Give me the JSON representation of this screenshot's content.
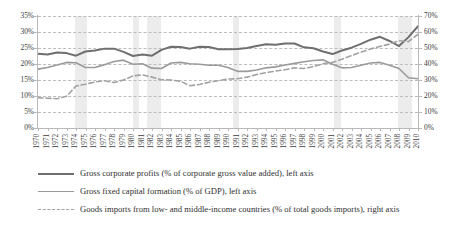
{
  "chart_data": {
    "type": "line",
    "title": "",
    "xlabel": "",
    "ylabel": "",
    "grid": true,
    "legend_position": "bottom-left",
    "x": [
      1970,
      1971,
      1972,
      1973,
      1974,
      1975,
      1976,
      1977,
      1978,
      1979,
      1980,
      1981,
      1982,
      1983,
      1984,
      1985,
      1986,
      1987,
      1988,
      1989,
      1990,
      1991,
      1992,
      1993,
      1994,
      1995,
      1996,
      1997,
      1998,
      1999,
      2000,
      2001,
      2002,
      2003,
      2004,
      2005,
      2006,
      2007,
      2008,
      2009,
      2010
    ],
    "xtick_labels": [
      "1970",
      "1971",
      "1972",
      "1973",
      "1974",
      "1975",
      "1976",
      "1977",
      "1978",
      "1979",
      "1980",
      "1981",
      "1982",
      "1983",
      "1984",
      "1985",
      "1986",
      "1987",
      "1988",
      "1989",
      "1990",
      "1991",
      "1992",
      "1993",
      "1994",
      "1995",
      "1996",
      "1997",
      "1998",
      "1999",
      "2000",
      "2001",
      "2002",
      "2003",
      "2004",
      "2005",
      "2006",
      "2007",
      "2008",
      "2009",
      "2010"
    ],
    "left_axis": {
      "label": "left axis",
      "ylim": [
        0,
        35
      ],
      "ticks": [
        0,
        5,
        10,
        15,
        20,
        25,
        30,
        35
      ],
      "tick_labels": [
        "0%",
        "5%",
        "10%",
        "15%",
        "20%",
        "25%",
        "30%",
        "35%"
      ]
    },
    "right_axis": {
      "label": "right axis",
      "ylim": [
        0,
        70
      ],
      "ticks": [
        0,
        10,
        20,
        30,
        40,
        50,
        60,
        70
      ],
      "tick_labels": [
        "0%",
        "10%",
        "20%",
        "30%",
        "40%",
        "50%",
        "60%",
        "70%"
      ]
    },
    "recession_bands": [
      {
        "start": 1973.9,
        "end": 1975.2
      },
      {
        "start": 1980.0,
        "end": 1980.6
      },
      {
        "start": 1981.5,
        "end": 1982.9
      },
      {
        "start": 1990.5,
        "end": 1991.2
      },
      {
        "start": 2001.2,
        "end": 2001.9
      },
      {
        "start": 2007.9,
        "end": 2009.4
      }
    ],
    "series": [
      {
        "name": "Gross corporate profits (% of corporate gross value added), left axis",
        "axis": "left",
        "style": "solid",
        "color": "#6f6f6f",
        "width": 2.0,
        "values": [
          23.2,
          23.0,
          23.6,
          23.4,
          22.6,
          23.9,
          24.2,
          24.8,
          24.8,
          23.8,
          22.5,
          23.0,
          22.6,
          24.4,
          25.4,
          25.3,
          24.8,
          25.4,
          25.3,
          24.6,
          24.6,
          24.7,
          25.0,
          25.6,
          26.2,
          26.0,
          26.4,
          26.4,
          25.2,
          24.9,
          23.9,
          23.1,
          24.2,
          25.1,
          26.3,
          27.6,
          28.5,
          27.2,
          25.6,
          28.4,
          31.8
        ]
      },
      {
        "name": "Gross fixed capital formation (% of GDP), left axis",
        "axis": "left",
        "style": "solid",
        "color": "#9a9a9a",
        "width": 1.6,
        "values": [
          18.4,
          18.9,
          19.7,
          20.5,
          20.4,
          18.9,
          18.9,
          19.8,
          20.8,
          21.2,
          19.9,
          20.1,
          18.7,
          18.6,
          20.3,
          20.5,
          20.1,
          19.9,
          19.6,
          19.6,
          18.9,
          17.7,
          17.7,
          18.1,
          18.8,
          19.1,
          19.7,
          20.2,
          20.7,
          21.1,
          21.3,
          19.9,
          18.8,
          18.9,
          19.6,
          20.3,
          20.5,
          19.6,
          18.6,
          15.7,
          15.4
        ]
      },
      {
        "name": "Goods imports from low- and middle-income countries (% of total goods imports), right axis",
        "axis": "right",
        "style": "dashed",
        "color": "#a2a2a2",
        "width": 1.6,
        "values": [
          19.0,
          18.6,
          18.3,
          19.8,
          26.2,
          27.4,
          28.8,
          29.6,
          28.4,
          30.0,
          32.6,
          33.2,
          31.8,
          30.2,
          30.0,
          29.2,
          26.4,
          27.2,
          28.6,
          29.6,
          30.6,
          30.8,
          31.8,
          33.4,
          34.6,
          35.6,
          36.4,
          37.6,
          37.2,
          38.4,
          40.2,
          41.0,
          43.0,
          45.2,
          47.4,
          49.4,
          51.0,
          52.4,
          54.6,
          54.0,
          58.6
        ]
      }
    ]
  },
  "legend": {
    "items": [
      {
        "label": "Gross corporate profits (% of corporate gross value added), left axis",
        "style": "solid",
        "color": "#6f6f6f",
        "width": 2.4
      },
      {
        "label": "Gross fixed capital formation (% of GDP), left axis",
        "style": "solid",
        "color": "#9a9a9a",
        "width": 1.7
      },
      {
        "label": "Goods imports from low- and middle-income countries (% of total goods imports), right axis",
        "style": "dashed",
        "color": "#a2a2a2",
        "width": 1.7
      }
    ]
  },
  "colors": {
    "grid": "#bdbdbd",
    "axis": "#b9b9b9",
    "band": "#ececec",
    "text": "#3b3b3b"
  }
}
